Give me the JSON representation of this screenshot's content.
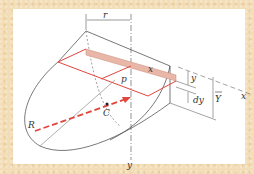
{
  "figure": {
    "labels": {
      "r": "r",
      "x_top": "x",
      "p": "p",
      "y_dim": "y",
      "x_axis": "x",
      "dy": "dy",
      "Y_bar": "Y",
      "R": "R",
      "C": "C",
      "y_axis": "y"
    },
    "colors": {
      "background_texture": "#f3ddb6",
      "panel": "#ffffff",
      "outline": "#555555",
      "red_line": "#e0463c",
      "strip_fill": "#e8b7a8",
      "dashed_arrow": "#e0463c"
    }
  }
}
